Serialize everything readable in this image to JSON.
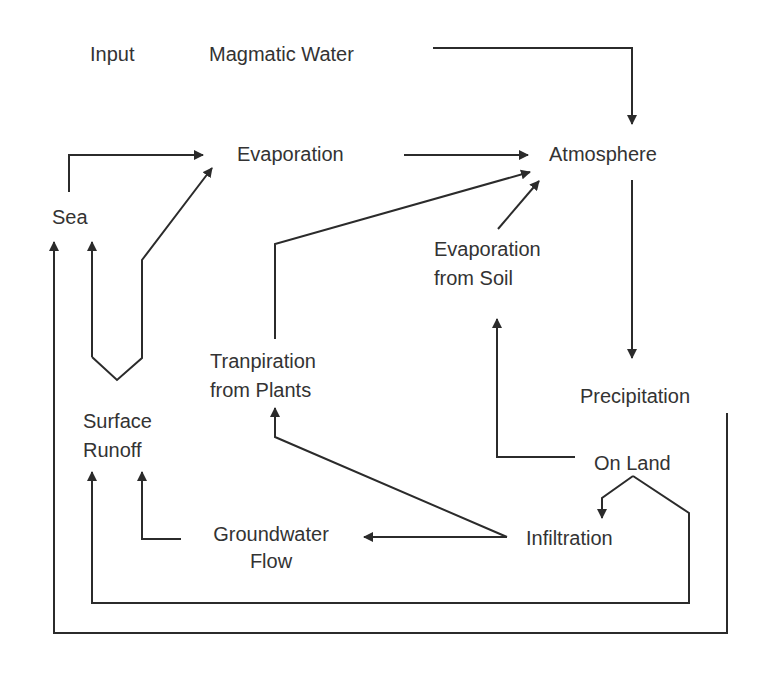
{
  "diagram": {
    "nodes": {
      "input": "Input",
      "magmatic_water": "Magmatic Water",
      "evaporation": "Evaporation",
      "atmosphere": "Atmosphere",
      "sea": "Sea",
      "evaporation_from_soil_l1": "Evaporation",
      "evaporation_from_soil_l2": "from Soil",
      "tranpiration_l1": "Tranpiration",
      "tranpiration_l2": "from Plants",
      "precipitation": "Precipitation",
      "surface_runoff_l1": "Surface",
      "surface_runoff_l2": "Runoff",
      "on_land": "On Land",
      "groundwater_flow_l1": "Groundwater",
      "groundwater_flow_l2": "Flow",
      "infiltration": "Infiltration"
    },
    "edges": [
      {
        "from": "Magmatic Water",
        "to": "Atmosphere"
      },
      {
        "from": "Sea",
        "to": "Evaporation"
      },
      {
        "from": "Surface Runoff",
        "to": "Evaporation"
      },
      {
        "from": "Surface Runoff",
        "to": "Sea"
      },
      {
        "from": "Evaporation",
        "to": "Atmosphere"
      },
      {
        "from": "Tranpiration from Plants",
        "to": "Atmosphere"
      },
      {
        "from": "Evaporation from Soil",
        "to": "Atmosphere"
      },
      {
        "from": "Atmosphere",
        "to": "Precipitation"
      },
      {
        "from": "Precipitation",
        "to": "Sea"
      },
      {
        "from": "On Land",
        "to": "Evaporation from Soil"
      },
      {
        "from": "On Land",
        "to": "Infiltration"
      },
      {
        "from": "On Land",
        "to": "Surface Runoff"
      },
      {
        "from": "Infiltration",
        "to": "Groundwater Flow"
      },
      {
        "from": "Infiltration",
        "to": "Tranpiration from Plants"
      },
      {
        "from": "Groundwater Flow",
        "to": "Surface Runoff"
      }
    ],
    "colors": {
      "line": "#2b2b2b",
      "text": "#333333",
      "background": "#ffffff"
    }
  }
}
